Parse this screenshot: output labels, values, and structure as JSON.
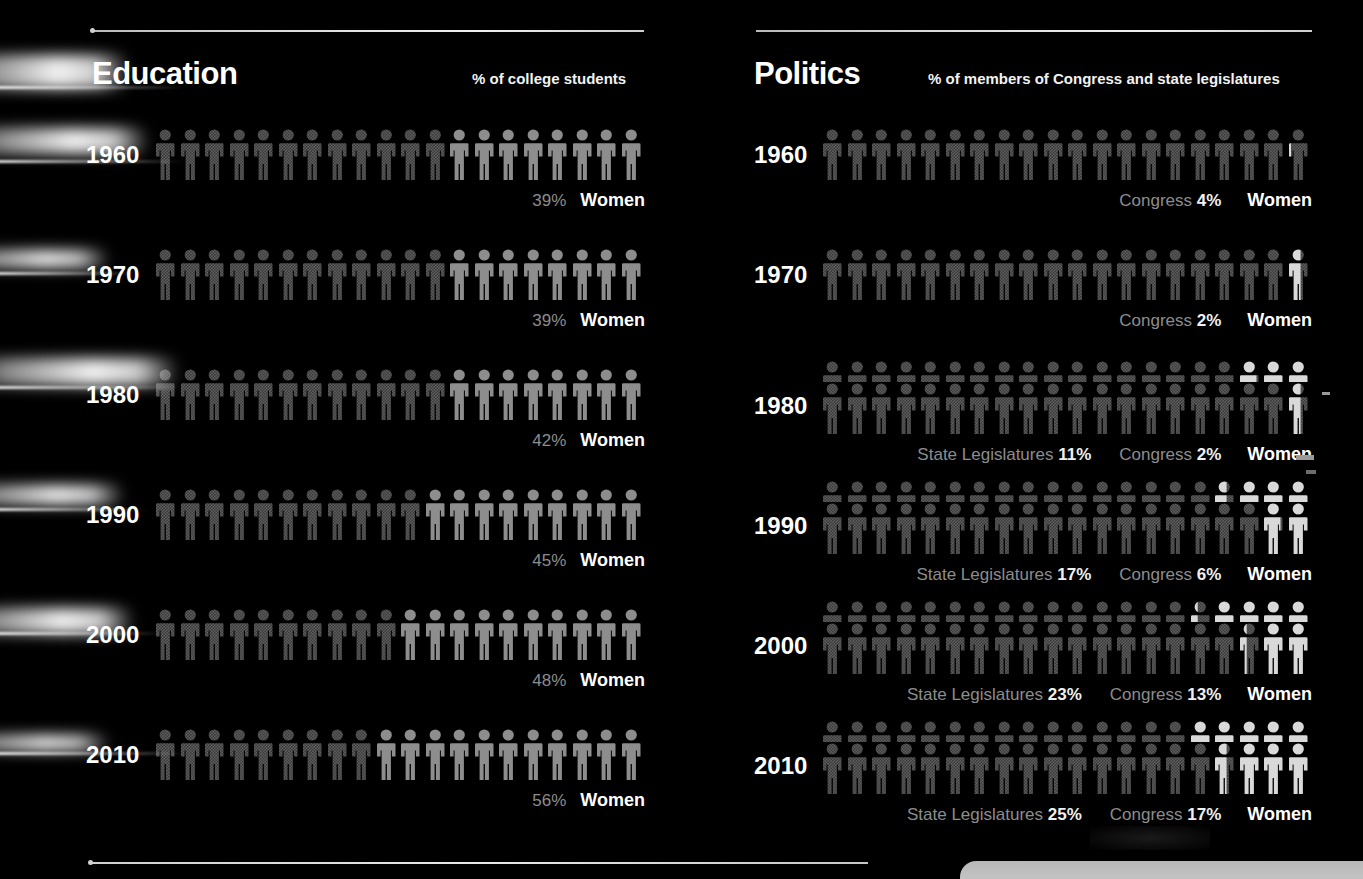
{
  "background": "#000000",
  "colors": {
    "men": "#5e5e5e",
    "men_texture": "#3a3a3a",
    "women_education": "#8d8d8d",
    "women_politics": "#d9d9d9",
    "percent_label": "#8d8d8d",
    "percent_value": "#f0f0f0",
    "women_label": "#ffffff",
    "rule": "#d8d8d8",
    "corner_panel": "#bdbdbd"
  },
  "units_per_row": 20,
  "percent_per_figure": 5,
  "panels": [
    {
      "id": "education",
      "title": "Education",
      "subtitle": "% of college students",
      "women_label": "Women",
      "rows": [
        {
          "year": "1960",
          "women_pct": "39%",
          "women_figures": 8,
          "men_figures": 12
        },
        {
          "year": "1970",
          "women_pct": "39%",
          "women_figures": 8,
          "men_figures": 12
        },
        {
          "year": "1980",
          "women_pct": "42%",
          "women_figures": 8,
          "men_figures": 12
        },
        {
          "year": "1990",
          "women_pct": "45%",
          "women_figures": 9,
          "men_figures": 11
        },
        {
          "year": "2000",
          "women_pct": "48%",
          "women_figures": 10,
          "men_figures": 10
        },
        {
          "year": "2010",
          "women_pct": "56%",
          "women_figures": 11,
          "men_figures": 9
        }
      ]
    },
    {
      "id": "politics",
      "title": "Politics",
      "subtitle": "% of members of Congress and state legislatures",
      "women_label": "Women",
      "congress_label": "Congress",
      "state_label": "State Legislatures",
      "rows": [
        {
          "year": "1960",
          "congress_pct": "4%",
          "congress_women_figures": 0.8,
          "state_pct": null,
          "state_women_figures": null
        },
        {
          "year": "1970",
          "congress_pct": "2%",
          "congress_women_figures": 0.4,
          "state_pct": null,
          "state_women_figures": null
        },
        {
          "year": "1980",
          "congress_pct": "2%",
          "congress_women_figures": 0.4,
          "state_pct": "11%",
          "state_women_figures": 2.2
        },
        {
          "year": "1990",
          "congress_pct": "6%",
          "congress_women_figures": 1.2,
          "state_pct": "17%",
          "state_women_figures": 3.4
        },
        {
          "year": "2000",
          "congress_pct": "13%",
          "congress_women_figures": 2.6,
          "state_pct": "23%",
          "state_women_figures": 4.6
        },
        {
          "year": "2010",
          "congress_pct": "17%",
          "congress_women_figures": 3.4,
          "state_pct": "25%",
          "state_women_figures": 5.0
        }
      ]
    }
  ],
  "chart_data": {
    "type": "bar",
    "categories": [
      "1960",
      "1970",
      "1980",
      "1990",
      "2000",
      "2010"
    ],
    "xlabel": "Year",
    "ylabel": "% Women",
    "ylim": [
      0,
      100
    ],
    "grid": false,
    "legend": "inline",
    "series": [
      {
        "name": "Education — % of college students",
        "values": [
          39,
          39,
          42,
          45,
          48,
          56
        ]
      },
      {
        "name": "Politics — Congress %",
        "values": [
          4,
          2,
          2,
          6,
          13,
          17
        ]
      },
      {
        "name": "Politics — State Legislatures %",
        "values": [
          null,
          null,
          11,
          17,
          23,
          25
        ]
      }
    ],
    "annotations": [
      "Each pictogram row contains 20 figures; one figure = 5%.",
      "Education subtitle: % of college students",
      "Politics subtitle: % of members of Congress and state legislatures"
    ]
  }
}
